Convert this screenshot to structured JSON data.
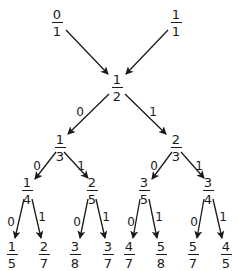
{
  "colors": {
    "ink": "#1a1a1a",
    "background": "#ffffff"
  },
  "nodes": [
    {
      "id": "n01",
      "num": "0",
      "den": "1",
      "x": 57,
      "y": 8
    },
    {
      "id": "n11",
      "num": "1",
      "den": "1",
      "x": 176,
      "y": 8
    },
    {
      "id": "n12",
      "num": "1",
      "den": "2",
      "x": 117,
      "y": 73
    },
    {
      "id": "n13",
      "num": "1",
      "den": "3",
      "x": 60,
      "y": 133
    },
    {
      "id": "n23",
      "num": "2",
      "den": "3",
      "x": 176,
      "y": 133
    },
    {
      "id": "n14",
      "num": "1",
      "den": "4",
      "x": 27,
      "y": 176
    },
    {
      "id": "n25",
      "num": "2",
      "den": "5",
      "x": 92,
      "y": 176
    },
    {
      "id": "n35",
      "num": "3",
      "den": "5",
      "x": 144,
      "y": 176
    },
    {
      "id": "n34",
      "num": "3",
      "den": "4",
      "x": 208,
      "y": 176
    },
    {
      "id": "n15",
      "num": "1",
      "den": "5",
      "x": 12,
      "y": 240
    },
    {
      "id": "n27",
      "num": "2",
      "den": "7",
      "x": 44,
      "y": 240
    },
    {
      "id": "n38",
      "num": "3",
      "den": "8",
      "x": 75,
      "y": 240
    },
    {
      "id": "n37",
      "num": "3",
      "den": "7",
      "x": 108,
      "y": 240
    },
    {
      "id": "n47",
      "num": "4",
      "den": "7",
      "x": 129,
      "y": 240
    },
    {
      "id": "n58",
      "num": "5",
      "den": "8",
      "x": 161,
      "y": 240
    },
    {
      "id": "n57",
      "num": "5",
      "den": "7",
      "x": 193,
      "y": 240
    },
    {
      "id": "n45",
      "num": "4",
      "den": "5",
      "x": 226,
      "y": 240
    }
  ],
  "edges": [
    {
      "x1": 66,
      "y1": 30,
      "x2": 108,
      "y2": 74,
      "label": ""
    },
    {
      "x1": 168,
      "y1": 30,
      "x2": 126,
      "y2": 74,
      "label": ""
    },
    {
      "x1": 109,
      "y1": 94,
      "x2": 68,
      "y2": 134,
      "label": "0",
      "lx": 80,
      "ly": 106
    },
    {
      "x1": 125,
      "y1": 94,
      "x2": 166,
      "y2": 134,
      "label": "1",
      "lx": 153,
      "ly": 106
    },
    {
      "x1": 56,
      "y1": 152,
      "x2": 35,
      "y2": 179,
      "label": "0",
      "lx": 37,
      "ly": 160
    },
    {
      "x1": 64,
      "y1": 152,
      "x2": 88,
      "y2": 178,
      "label": "1",
      "lx": 81,
      "ly": 160
    },
    {
      "x1": 172,
      "y1": 152,
      "x2": 152,
      "y2": 179,
      "label": "0",
      "lx": 154,
      "ly": 160
    },
    {
      "x1": 181,
      "y1": 152,
      "x2": 204,
      "y2": 178,
      "label": "1",
      "lx": 199,
      "ly": 160
    },
    {
      "x1": 24,
      "y1": 199,
      "x2": 15,
      "y2": 238,
      "label": "0",
      "lx": 11,
      "ly": 216
    },
    {
      "x1": 32,
      "y1": 199,
      "x2": 41,
      "y2": 238,
      "label": "1",
      "lx": 42,
      "ly": 211
    },
    {
      "x1": 88,
      "y1": 199,
      "x2": 80,
      "y2": 238,
      "label": "0",
      "lx": 77,
      "ly": 216
    },
    {
      "x1": 96,
      "y1": 199,
      "x2": 105,
      "y2": 238,
      "label": "1",
      "lx": 106,
      "ly": 211
    },
    {
      "x1": 140,
      "y1": 199,
      "x2": 133,
      "y2": 238,
      "label": "0",
      "lx": 131,
      "ly": 216
    },
    {
      "x1": 149,
      "y1": 199,
      "x2": 157,
      "y2": 238,
      "label": "1",
      "lx": 159,
      "ly": 211
    },
    {
      "x1": 204,
      "y1": 199,
      "x2": 197,
      "y2": 238,
      "label": "0",
      "lx": 194,
      "ly": 216
    },
    {
      "x1": 213,
      "y1": 199,
      "x2": 222,
      "y2": 238,
      "label": "1",
      "lx": 223,
      "ly": 211
    }
  ]
}
